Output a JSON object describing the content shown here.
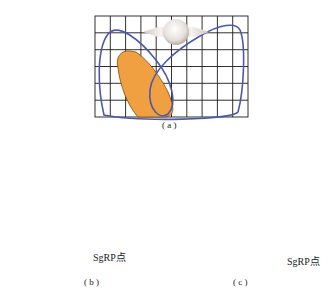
{
  "panels": {
    "a": {
      "label": "( a )"
    },
    "b": {
      "label": "( b )",
      "marker_label": "SgRP点"
    },
    "c": {
      "label": "( c )",
      "marker_label": "SgRP点"
    }
  },
  "colors": {
    "grid": "#1a1a1a",
    "contour": "#4a5aa8",
    "zone_fill": "#f0a040",
    "zone_stroke": "#7a4a10",
    "sgrp_marker": "#f06040",
    "figure": "#e8e4e2"
  }
}
